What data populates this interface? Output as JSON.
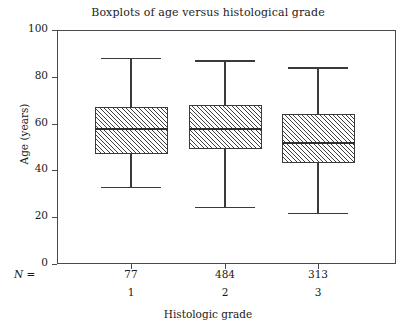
{
  "chart_data": {
    "type": "box",
    "title": "Boxplots of age versus histological grade",
    "xlabel": "Histologic grade",
    "ylabel": "Age (years)",
    "ylim": [
      0,
      100
    ],
    "yticks": [
      0,
      20,
      40,
      60,
      80,
      100
    ],
    "ytick_labels": [
      "0",
      "20",
      "40",
      "60",
      "80",
      "100"
    ],
    "grid": false,
    "legend": null,
    "n_label": "N =",
    "categories": [
      "1",
      "2",
      "3"
    ],
    "counts": [
      "77",
      "484",
      "313"
    ],
    "boxes": [
      {
        "category": "1",
        "n": 77,
        "whisker_low": 33,
        "q1": 47,
        "median": 58,
        "q3": 67,
        "whisker_high": 88
      },
      {
        "category": "2",
        "n": 484,
        "whisker_low": 24.5,
        "q1": 49,
        "median": 58,
        "q3": 68,
        "whisker_high": 87
      },
      {
        "category": "3",
        "n": 313,
        "whisker_low": 22,
        "q1": 43,
        "median": 52,
        "q3": 64,
        "whisker_high": 84
      }
    ],
    "colors": {
      "axis": "#4a4a4a",
      "box_outline": "#3a3a3a",
      "box_hatch": "#3f3f3f",
      "median": "#2e2e2e",
      "background": "#ffffff",
      "text": "#1c1c1c"
    }
  }
}
